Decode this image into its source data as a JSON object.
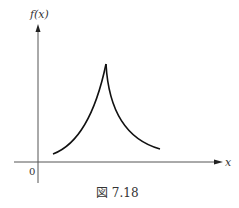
{
  "figure": {
    "y_axis_label": "f(x)",
    "x_axis_label": "x",
    "origin_label": "0",
    "caption": "図 7.18"
  },
  "curve": {
    "description": "cusp-shaped curve peaking at a sharp point, decaying symmetrically on both sides",
    "shape": "cusp"
  }
}
